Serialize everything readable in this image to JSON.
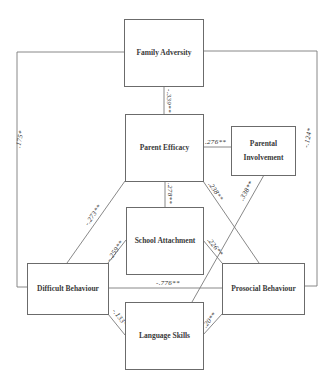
{
  "diagram": {
    "nodes": {
      "family_adversity": {
        "label": "Family Adversity"
      },
      "parent_efficacy": {
        "label": "Parent Efficacy"
      },
      "parental_involvement": {
        "line1": "Parental",
        "line2": "Involvement"
      },
      "school_attachment": {
        "label": "School Attachment"
      },
      "difficult_behaviour": {
        "label": "Difficult Behaviour"
      },
      "prosocial_behaviour": {
        "label": "Prosocial Behaviour"
      },
      "language_skills": {
        "label": "Language Skills"
      }
    },
    "edges": [
      {
        "from": "Family Adversity",
        "to": "Parent Efficacy",
        "coef": "-.339**"
      },
      {
        "from": "Family Adversity",
        "to": "Difficult Behaviour",
        "coef": ".175*"
      },
      {
        "from": "Family Adversity",
        "to": "Prosocial Behaviour",
        "coef": "-.124*"
      },
      {
        "from": "Parent Efficacy",
        "to": "Parental Involvement",
        "coef": ".276**"
      },
      {
        "from": "Parent Efficacy",
        "to": "School Attachment",
        "coef": ".278**"
      },
      {
        "from": "Parent Efficacy",
        "to": "Difficult Behaviour",
        "coef": "-.273**"
      },
      {
        "from": "Parent Efficacy",
        "to": "Prosocial Behaviour",
        "coef": ".238**"
      },
      {
        "from": "Parental Involvement",
        "to": "Language Skills",
        "coef": ".338**"
      },
      {
        "from": "School Attachment",
        "to": "Difficult Behaviour",
        "coef": "-.259**"
      },
      {
        "from": "School Attachment",
        "to": "Prosocial Behaviour",
        "coef": ".226**"
      },
      {
        "from": "Difficult Behaviour",
        "to": "Prosocial Behaviour",
        "coef": "-.776**"
      },
      {
        "from": "Difficult Behaviour",
        "to": "Language Skills",
        "coef": "-.133**"
      },
      {
        "from": "Prosocial Behaviour",
        "to": "Language Skills",
        "coef": ".20**"
      }
    ]
  }
}
